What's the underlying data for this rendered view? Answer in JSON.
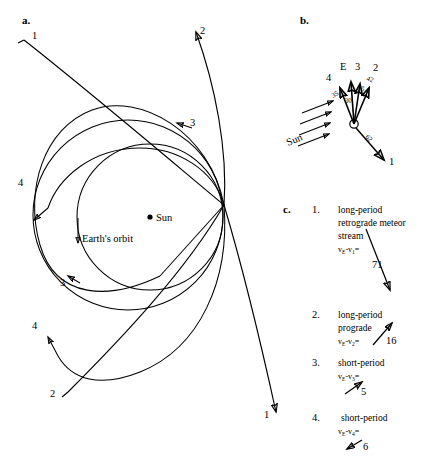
{
  "figure": {
    "panels": [
      {
        "id": "a",
        "letter": "a.",
        "sun_label": "Sun",
        "earth_orbit_label": "Earth's orbit",
        "trajectory_labels": [
          {
            "name": "traj-1-top-left",
            "text": "1"
          },
          {
            "name": "traj-2-top",
            "text": "2"
          },
          {
            "name": "traj-3-right",
            "text": "3"
          },
          {
            "name": "traj-4-left",
            "text": "4"
          },
          {
            "name": "traj-3-lower-left",
            "text": "3"
          },
          {
            "name": "traj-4-lower-left",
            "text": "4"
          },
          {
            "name": "traj-2-bottom-left",
            "text": "2"
          },
          {
            "name": "traj-1-bottom",
            "text": "1"
          }
        ]
      },
      {
        "id": "b",
        "letter": "b.",
        "sun_label": "Sun",
        "earth_label": "E",
        "vector_labels": [
          {
            "name": "vector-label-2",
            "text": "2"
          },
          {
            "name": "vector-label-3",
            "text": "3"
          },
          {
            "name": "vector-label-4",
            "text": "4"
          },
          {
            "name": "vector-label-1",
            "text": "1"
          }
        ],
        "speed_values": [
          {
            "name": "speed-42",
            "text": "42"
          },
          {
            "name": "speed-35-right",
            "text": "35"
          },
          {
            "name": "speed-30",
            "text": "30"
          },
          {
            "name": "speed-35-left",
            "text": "35"
          },
          {
            "name": "speed-62",
            "text": "62"
          }
        ]
      },
      {
        "id": "c",
        "letter": "c.",
        "items": [
          {
            "number": "1.",
            "lines": [
              "long-period",
              "retrograde meteor",
              "stream"
            ],
            "formula": {
              "v_e": "v",
              "sub_e": "E",
              "minus": "-",
              "v_i": "v",
              "sub_i": "1",
              "equals": "="
            },
            "value": "71",
            "arrow": "down-right"
          },
          {
            "number": "2.",
            "lines": [
              "long-period",
              "prograde"
            ],
            "formula": {
              "v_e": "v",
              "sub_e": "E",
              "minus": "-",
              "v_i": "v",
              "sub_i": "2",
              "equals": "="
            },
            "value": "16",
            "arrow": "up-right"
          },
          {
            "number": "3.",
            "lines": [
              "short-period"
            ],
            "formula": {
              "v_e": "v",
              "sub_e": "E",
              "minus": "-",
              "v_i": "v",
              "sub_i": "3",
              "equals": "="
            },
            "value": "5",
            "arrow": "up-right"
          },
          {
            "number": "4.",
            "lines": [
              "short-period"
            ],
            "formula": {
              "v_e": "v",
              "sub_e": "E",
              "minus": "-",
              "v_i": "v",
              "sub_i": "4",
              "equals": "="
            },
            "value": "6",
            "arrow": "down-left"
          }
        ]
      }
    ]
  },
  "colors": {
    "ink": "#000000",
    "background": "#ffffff"
  }
}
